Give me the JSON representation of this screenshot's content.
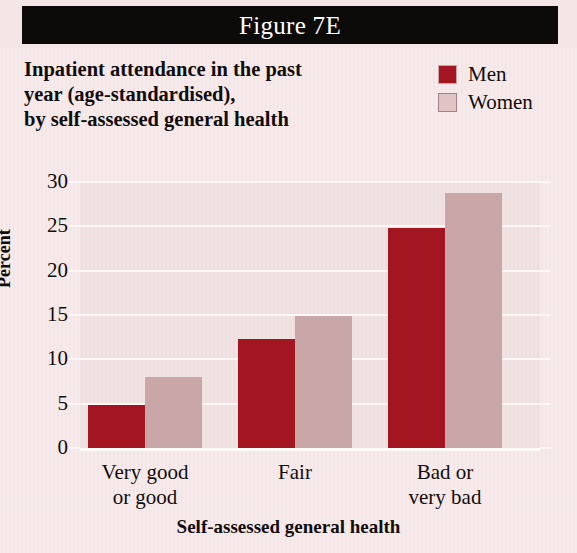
{
  "banner": {
    "label": "Figure 7E"
  },
  "title": {
    "lines": [
      "Inpatient attendance in the past",
      "year (age-standardised),",
      "by self-assessed general health"
    ]
  },
  "legend": {
    "position": "top-right",
    "items": [
      {
        "label": "Men",
        "color": "#a31520"
      },
      {
        "label": "Women",
        "color": "#c9a6a8"
      }
    ]
  },
  "axes": {
    "y_title": "Percent",
    "x_title": "Self-assessed general health",
    "y_ticks": [
      "0",
      "5",
      "10",
      "15",
      "20",
      "25",
      "30"
    ]
  },
  "categories_display": [
    {
      "lines": [
        "Very good",
        "or good"
      ]
    },
    {
      "lines": [
        "Fair"
      ]
    },
    {
      "lines": [
        "Bad or",
        "very bad"
      ]
    }
  ],
  "colors": {
    "banner_bg": "#0d0a0a",
    "banner_text": "#ffffff",
    "page_bg": "#f4e6e6",
    "plot_bg": "#eedede",
    "gridline": "#fdf6f6",
    "men": "#a31520",
    "women": "#c9a6a8",
    "text": "#120d0d"
  },
  "chart_data": {
    "type": "bar",
    "title": "Inpatient attendance in the past year (age-standardised), by self-assessed general health",
    "categories": [
      "Very good or good",
      "Fair",
      "Bad or very bad"
    ],
    "series": [
      {
        "name": "Men",
        "values": [
          4.9,
          12.3,
          24.8
        ]
      },
      {
        "name": "Women",
        "values": [
          8.0,
          14.9,
          28.8
        ]
      }
    ],
    "xlabel": "Self-assessed general health",
    "ylabel": "Percent",
    "ylim": [
      0,
      30
    ],
    "ytick_step": 5,
    "grid": true,
    "legend_position": "top-right"
  }
}
